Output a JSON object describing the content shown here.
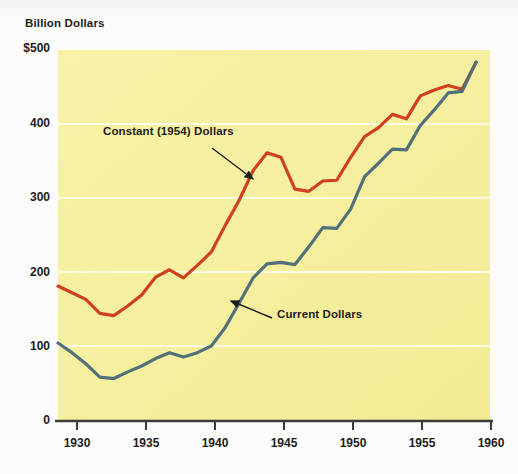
{
  "figure": {
    "y_axis_title": "Billion Dollars",
    "plot_background": "#f5ef9a",
    "page_background": "#fdfdfd",
    "gridline_color": "#fdfbe2",
    "axis_color": "#3c3c38"
  },
  "chart_data": {
    "type": "line",
    "title": "",
    "subtitle": "",
    "xlabel": "",
    "ylabel": "Billion Dollars",
    "xlim": [
      1929,
      1960
    ],
    "ylim": [
      0,
      500
    ],
    "grid": true,
    "grid_axis": "y",
    "legend": "annotations-inline",
    "x_ticks": [
      1930,
      1935,
      1940,
      1945,
      1950,
      1955,
      1960
    ],
    "x_tick_labels": [
      "1930",
      "1935",
      "1940",
      "1945",
      "1950",
      "1955",
      "1960"
    ],
    "y_ticks": [
      0,
      100,
      200,
      300,
      400,
      500
    ],
    "y_tick_labels": [
      "0",
      "100",
      "200",
      "300",
      "400",
      "$500"
    ],
    "x": [
      1929,
      1930,
      1931,
      1932,
      1933,
      1934,
      1935,
      1936,
      1937,
      1938,
      1939,
      1940,
      1941,
      1942,
      1943,
      1944,
      1945,
      1946,
      1947,
      1948,
      1949,
      1950,
      1951,
      1952,
      1953,
      1954,
      1955,
      1956,
      1957,
      1958,
      1959
    ],
    "series": [
      {
        "name": "Constant (1954) Dollars",
        "color": "#d1401c",
        "values": [
          181,
          172,
          163,
          144,
          141,
          154,
          169,
          193,
          203,
          192,
          209,
          227,
          263,
          297,
          337,
          361,
          355,
          312,
          309,
          323,
          324,
          355,
          383,
          395,
          413,
          407,
          438,
          446,
          452,
          447,
          483
        ]
      },
      {
        "name": "Current Dollars",
        "color": "#51707a",
        "values": [
          104,
          91,
          76,
          58,
          56,
          65,
          73,
          83,
          91,
          85,
          91,
          100,
          125,
          158,
          192,
          211,
          213,
          210,
          234,
          260,
          259,
          285,
          329,
          347,
          366,
          365,
          398,
          419,
          442,
          444,
          484
        ]
      }
    ],
    "annotations": [
      {
        "text": "Constant (1954) Dollars",
        "label_x_px": 103,
        "label_y_px": 132,
        "arrow_from_px": [
          212,
          148
        ],
        "arrow_to_px": [
          256,
          181
        ]
      },
      {
        "text": "Current Dollars",
        "label_x_px": 277,
        "label_y_px": 315,
        "arrow_from_px": [
          272,
          318
        ],
        "arrow_to_px": [
          228,
          300
        ]
      }
    ]
  },
  "y_tick_positions_px": [
    {
      "label": "$500",
      "top": 41
    },
    {
      "label": "400",
      "top": 116
    },
    {
      "label": "300",
      "top": 190
    },
    {
      "label": "200",
      "top": 265
    },
    {
      "label": "100",
      "top": 339
    },
    {
      "label": "0",
      "top": 414
    }
  ],
  "x_tick_positions_px": [
    {
      "label": "1930",
      "left": 47
    },
    {
      "label": "1935",
      "left": 116
    },
    {
      "label": "1940",
      "left": 185
    },
    {
      "label": "1945",
      "left": 254
    },
    {
      "label": "1950",
      "left": 323
    },
    {
      "label": "1955",
      "left": 392
    },
    {
      "label": "1960",
      "left": 461
    }
  ]
}
